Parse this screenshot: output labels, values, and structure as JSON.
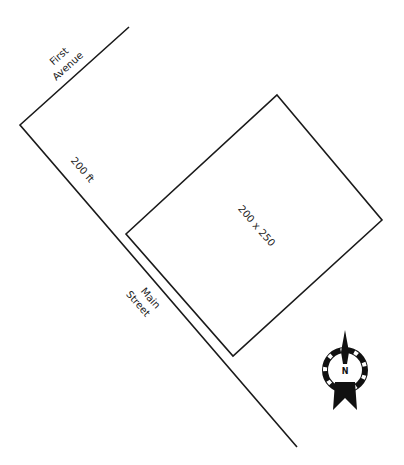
{
  "diagram": {
    "type": "site-plan",
    "streets": [
      {
        "name_line1": "First",
        "name_line2": "Avenue"
      },
      {
        "name_line1": "Main",
        "name_line2": "Street"
      }
    ],
    "frontage_label": "200 ft",
    "lot_label": "200 x 250",
    "compass": {
      "label": "N",
      "icon": "north-arrow-icon"
    },
    "colors": {
      "line": "#1a1a1a",
      "background": "#ffffff"
    }
  }
}
